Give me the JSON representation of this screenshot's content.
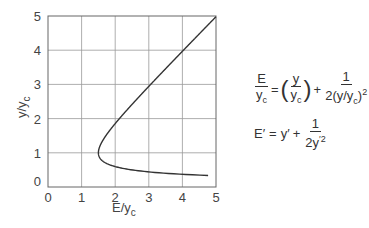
{
  "chart_data": {
    "type": "line",
    "title": "",
    "xlabel": "E/y_c",
    "ylabel": "y/y_c",
    "xlim": [
      0,
      5
    ],
    "ylim": [
      0,
      5
    ],
    "xticks": [
      "0",
      "1",
      "2",
      "3",
      "4",
      "5"
    ],
    "yticks": [
      "0",
      "1",
      "2",
      "3",
      "4",
      "5"
    ],
    "grid": true,
    "series": [
      {
        "name": "Specific energy curve E/y_c = y/y_c + 1/(2(y/y_c)^2)",
        "points": [
          [
            5.0,
            0.32
          ],
          [
            4.0,
            0.36
          ],
          [
            3.0,
            0.43
          ],
          [
            2.5,
            0.49
          ],
          [
            2.0,
            0.59
          ],
          [
            1.75,
            0.68
          ],
          [
            1.6,
            0.79
          ],
          [
            1.53,
            0.9
          ],
          [
            1.5,
            1.0
          ],
          [
            1.53,
            1.15
          ],
          [
            1.6,
            1.3
          ],
          [
            1.75,
            1.5
          ],
          [
            2.0,
            1.81
          ],
          [
            2.5,
            2.41
          ],
          [
            3.0,
            2.94
          ],
          [
            4.0,
            3.97
          ],
          [
            5.0,
            4.98
          ]
        ]
      }
    ],
    "annotations": [
      "E/y_c = (y/y_c) + 1/(2(y/y_c)^2)",
      "E' = y' + 1/(2y'^2)"
    ]
  },
  "labels": {
    "xlabel_main": "E/y",
    "xlabel_sub": "c",
    "ylabel_main": "y/y",
    "ylabel_sub": "c"
  },
  "equations": {
    "eq1": {
      "lhs_num": "E",
      "lhs_den_main": "y",
      "lhs_den_sub": "c",
      "eq_sign": "=",
      "paren_num": "y",
      "paren_den_main": "y",
      "paren_den_sub": "c",
      "plus": "+",
      "frac_num": "1",
      "frac_den_pre": "2(y/y",
      "frac_den_sub": "c",
      "frac_den_post": ")",
      "frac_den_sup": "2"
    },
    "eq2": {
      "lhs": "E′",
      "eq_sign": "=",
      "term": "y′",
      "plus": "+",
      "frac_num": "1",
      "frac_den": "2y",
      "frac_den_sup": "′2"
    }
  }
}
